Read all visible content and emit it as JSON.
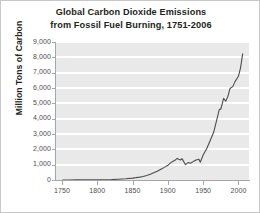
{
  "chart_data": {
    "type": "line",
    "title": "Global Carbon Dioxide Emissions\nfrom Fossil Fuel Burning, 1751-2006",
    "title_line1": "Global Carbon Dioxide Emissions",
    "title_line2": "from Fossil Fuel Burning, 1751-2006",
    "xlabel": "",
    "ylabel": "Million Tons of Carbon",
    "xlim": [
      1740,
      2015
    ],
    "ylim": [
      0,
      9000
    ],
    "grid": true,
    "legend": "none",
    "plot_background": "#e9e9e9",
    "gridline_color": "#ffffff",
    "line_color": "#4d4d4d",
    "axis_color": "#a6a6a6",
    "text_color": "#231f20",
    "tick_text_color": "#4d4d4d",
    "yticks": [
      0,
      1000,
      2000,
      3000,
      4000,
      5000,
      6000,
      7000,
      8000,
      9000
    ],
    "ytick_labels": [
      "0",
      "1,000",
      "2,000",
      "3,000",
      "4,000",
      "5,000",
      "6,000",
      "7,000",
      "8,000",
      "9,000"
    ],
    "xticks": [
      1750,
      1800,
      1850,
      1900,
      1950,
      2000
    ],
    "xtick_labels": [
      "1750",
      "1800",
      "1850",
      "1900",
      "1950",
      "2000"
    ],
    "x": [
      1751,
      1760,
      1770,
      1780,
      1790,
      1800,
      1810,
      1820,
      1830,
      1840,
      1850,
      1855,
      1860,
      1865,
      1870,
      1875,
      1880,
      1885,
      1890,
      1895,
      1900,
      1905,
      1910,
      1913,
      1918,
      1920,
      1925,
      1929,
      1932,
      1936,
      1940,
      1944,
      1946,
      1950,
      1955,
      1960,
      1965,
      1970,
      1973,
      1975,
      1979,
      1982,
      1985,
      1988,
      1992,
      1995,
      2000,
      2003,
      2006
    ],
    "y": [
      3,
      4,
      6,
      8,
      10,
      12,
      18,
      28,
      51,
      82,
      124,
      153,
      188,
      233,
      288,
      371,
      477,
      566,
      698,
      824,
      958,
      1163,
      1285,
      1408,
      1301,
      1395,
      1000,
      1145,
      1090,
      1200,
      1299,
      1356,
      1160,
      1630,
      2043,
      2577,
      3130,
      4053,
      4617,
      4614,
      5329,
      5133,
      5438,
      5966,
      6090,
      6400,
      6765,
      7315,
      8230
    ],
    "annotations": []
  }
}
